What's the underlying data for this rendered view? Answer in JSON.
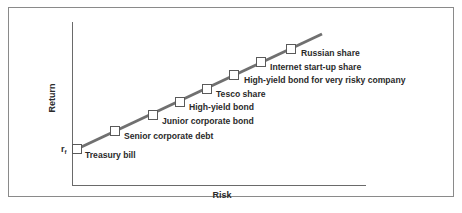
{
  "diagram": {
    "axes": {
      "x_label": "Risk",
      "y_label": "Return",
      "y_intercept_label": "r",
      "y_intercept_subscript": "f"
    },
    "colors": {
      "line": "#707070",
      "marker_fill": "#ffffff",
      "marker_stroke": "#5a5a5a",
      "text": "#2a2a2a",
      "frame": "#8a8a8a"
    },
    "points": [
      {
        "label": "Treasury bill"
      },
      {
        "label": "Senior corporate debt"
      },
      {
        "label": "Junior corporate bond"
      },
      {
        "label": "High-yield bond"
      },
      {
        "label": "Tesco share"
      },
      {
        "label": "High-yield bond for very risky company"
      },
      {
        "label": "Internet start-up share"
      },
      {
        "label": "Russian share"
      }
    ]
  }
}
